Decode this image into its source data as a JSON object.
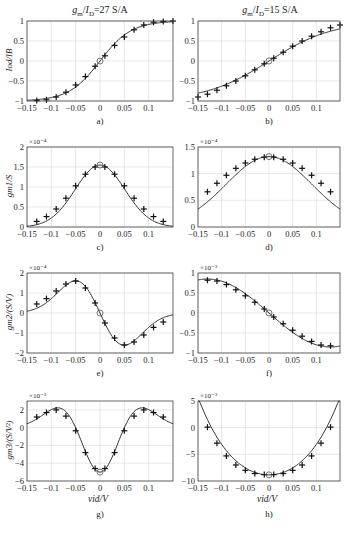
{
  "titles": {
    "left": "g_m / I_D = 27 S/A",
    "right": "g_m / I_D = 15 S/A"
  },
  "chart_data": [
    {
      "id": "a",
      "caption": "a)",
      "type": "line",
      "ylabel": "I_od / I_B",
      "xlabel": "",
      "exponent": "",
      "xlim": [
        -0.15,
        0.15
      ],
      "ylim": [
        -1,
        1
      ],
      "xticks": [
        -0.15,
        -0.1,
        -0.05,
        0,
        0.05,
        0.1
      ],
      "yticks": [
        -1,
        -0.5,
        0,
        0.5,
        1
      ],
      "ytick_labels": [
        "-1",
        "-0.5",
        "0",
        "0.5",
        "1"
      ],
      "grid": true,
      "x": [
        -0.13,
        -0.11,
        -0.09,
        -0.07,
        -0.05,
        -0.03,
        -0.01,
        0.01,
        0.03,
        0.05,
        0.07,
        0.09,
        0.11,
        0.13,
        0.15
      ],
      "y": [
        -0.99,
        -0.97,
        -0.9,
        -0.78,
        -0.6,
        -0.39,
        -0.13,
        0.13,
        0.39,
        0.6,
        0.78,
        0.9,
        0.97,
        0.99,
        1.0
      ],
      "marker_at_zero": "circle"
    },
    {
      "id": "b",
      "caption": "b)",
      "type": "line",
      "ylabel": "",
      "xlabel": "",
      "exponent": "",
      "xlim": [
        -0.15,
        0.15
      ],
      "ylim": [
        -1,
        1
      ],
      "xticks": [
        -0.15,
        -0.1,
        -0.05,
        0,
        0.05,
        0.1
      ],
      "yticks": [
        -1,
        -0.5,
        0,
        0.5,
        1
      ],
      "ytick_labels": [
        "-1",
        "-0.5",
        "0",
        "0.5",
        "1"
      ],
      "grid": true,
      "x": [
        -0.15,
        -0.13,
        -0.11,
        -0.09,
        -0.07,
        -0.05,
        -0.03,
        -0.01,
        0.01,
        0.03,
        0.05,
        0.07,
        0.09,
        0.11,
        0.13,
        0.15
      ],
      "y": [
        -0.9,
        -0.83,
        -0.73,
        -0.62,
        -0.5,
        -0.37,
        -0.22,
        -0.07,
        0.07,
        0.22,
        0.37,
        0.5,
        0.62,
        0.73,
        0.83,
        0.9
      ],
      "marker_at_zero": "circle"
    },
    {
      "id": "c",
      "caption": "c)",
      "type": "line",
      "ylabel": "g_m1 / S",
      "xlabel": "",
      "exponent": "×10⁻⁴",
      "xlim": [
        -0.15,
        0.15
      ],
      "ylim": [
        0,
        2
      ],
      "xticks": [
        -0.15,
        -0.1,
        -0.05,
        0,
        0.05,
        0.1
      ],
      "yticks": [
        0,
        0.5,
        1,
        1.5,
        2
      ],
      "ytick_labels": [
        "0",
        "0.5",
        "1",
        "1.5",
        "2"
      ],
      "grid": true,
      "x": [
        -0.13,
        -0.11,
        -0.09,
        -0.07,
        -0.05,
        -0.03,
        -0.01,
        0.01,
        0.03,
        0.05,
        0.07,
        0.09,
        0.11,
        0.13
      ],
      "y": [
        0.14,
        0.26,
        0.45,
        0.72,
        1.03,
        1.32,
        1.5,
        1.5,
        1.32,
        1.03,
        0.72,
        0.45,
        0.26,
        0.14
      ],
      "marker_at_zero": "circle"
    },
    {
      "id": "d",
      "caption": "d)",
      "type": "line",
      "ylabel": "",
      "xlabel": "",
      "exponent": "×10⁻⁴",
      "xlim": [
        -0.15,
        0.15
      ],
      "ylim": [
        0,
        1.5
      ],
      "xticks": [
        -0.15,
        -0.1,
        -0.05,
        0,
        0.05,
        0.1
      ],
      "yticks": [
        0,
        0.5,
        1,
        1.5
      ],
      "ytick_labels": [
        "0",
        "0.5",
        "1",
        "1.5"
      ],
      "grid": true,
      "x": [
        -0.13,
        -0.11,
        -0.09,
        -0.07,
        -0.05,
        -0.03,
        -0.01,
        0.01,
        0.03,
        0.05,
        0.07,
        0.09,
        0.11,
        0.13
      ],
      "y": [
        0.66,
        0.82,
        0.97,
        1.1,
        1.2,
        1.27,
        1.31,
        1.31,
        1.27,
        1.2,
        1.1,
        0.97,
        0.82,
        0.66
      ],
      "marker_at_zero": "circle"
    },
    {
      "id": "e",
      "caption": "e)",
      "type": "line",
      "ylabel": "g_m2 / (S/V)",
      "xlabel": "",
      "exponent": "×10⁻⁴",
      "xlim": [
        -0.15,
        0.15
      ],
      "ylim": [
        -2,
        2
      ],
      "xticks": [
        -0.15,
        -0.1,
        -0.05,
        0,
        0.05,
        0.1
      ],
      "yticks": [
        -2,
        -1,
        0,
        1,
        2
      ],
      "ytick_labels": [
        "-2",
        "-1",
        "0",
        "1",
        "2"
      ],
      "grid": true,
      "x": [
        -0.13,
        -0.11,
        -0.09,
        -0.07,
        -0.05,
        -0.03,
        -0.01,
        0.01,
        0.03,
        0.05,
        0.07,
        0.09,
        0.11,
        0.13
      ],
      "y": [
        0.45,
        0.72,
        1.1,
        1.45,
        1.6,
        1.25,
        0.5,
        -0.5,
        -1.25,
        -1.6,
        -1.45,
        -1.1,
        -0.72,
        -0.45
      ],
      "marker_at_zero": "circle"
    },
    {
      "id": "f",
      "caption": "f)",
      "type": "line",
      "ylabel": "",
      "xlabel": "",
      "exponent": "×10⁻³",
      "xlim": [
        -0.15,
        0.15
      ],
      "ylim": [
        -1,
        1
      ],
      "xticks": [
        -0.15,
        -0.1,
        -0.05,
        0,
        0.05,
        0.1
      ],
      "yticks": [
        -1,
        -0.5,
        0,
        0.5,
        1
      ],
      "ytick_labels": [
        "-1",
        "-0.5",
        "0",
        "0.5",
        "1"
      ],
      "grid": true,
      "x": [
        -0.13,
        -0.11,
        -0.09,
        -0.07,
        -0.05,
        -0.03,
        -0.01,
        0.01,
        0.03,
        0.05,
        0.07,
        0.09,
        0.11,
        0.13
      ],
      "y": [
        0.82,
        0.8,
        0.71,
        0.58,
        0.43,
        0.27,
        0.1,
        -0.1,
        -0.27,
        -0.43,
        -0.58,
        -0.71,
        -0.8,
        -0.82
      ],
      "marker_at_zero": "circle"
    },
    {
      "id": "g",
      "caption": "g)",
      "type": "line",
      "ylabel": "g_m3 / (S/V²)",
      "xlabel": "v_id / V",
      "exponent": "×10⁻³",
      "xlim": [
        -0.15,
        0.15
      ],
      "ylim": [
        -6,
        3
      ],
      "xticks": [
        -0.15,
        -0.1,
        -0.05,
        0,
        0.05,
        0.1
      ],
      "yticks": [
        -6,
        -4,
        -2,
        0,
        2
      ],
      "ytick_labels": [
        "-6",
        "-4",
        "-2",
        "0",
        "2"
      ],
      "grid": true,
      "x": [
        -0.13,
        -0.11,
        -0.09,
        -0.07,
        -0.05,
        -0.03,
        -0.01,
        0.01,
        0.03,
        0.05,
        0.07,
        0.09,
        0.11,
        0.13
      ],
      "y": [
        1.2,
        1.7,
        2.0,
        1.3,
        -0.35,
        -2.8,
        -4.6,
        -4.6,
        -2.8,
        -0.35,
        1.3,
        2.0,
        1.7,
        1.2
      ],
      "marker_at_zero": "circle"
    },
    {
      "id": "h",
      "caption": "h)",
      "type": "line",
      "ylabel": "",
      "xlabel": "v_id / V",
      "exponent": "×10⁻³",
      "xlim": [
        -0.15,
        0.15
      ],
      "ylim": [
        -10,
        5
      ],
      "xticks": [
        -0.15,
        -0.1,
        -0.05,
        0,
        0.05,
        0.1
      ],
      "yticks": [
        -10,
        -5,
        0,
        5
      ],
      "ytick_labels": [
        "-10",
        "-5",
        "0",
        "5"
      ],
      "grid": true,
      "x": [
        -0.13,
        -0.11,
        -0.09,
        -0.07,
        -0.05,
        -0.03,
        -0.01,
        0.01,
        0.03,
        0.05,
        0.07,
        0.09,
        0.11,
        0.13
      ],
      "y": [
        0.1,
        -2.9,
        -5.3,
        -7.0,
        -8.0,
        -8.6,
        -8.8,
        -8.8,
        -8.6,
        -8.0,
        -7.0,
        -5.3,
        -2.9,
        0.1
      ],
      "marker_at_zero": "circle"
    }
  ],
  "xtick_labels": [
    "-0.15",
    "-0.1",
    "-0.05",
    "0",
    "0.05",
    "0.1"
  ],
  "colors": {
    "line": "#333333",
    "grid": "#d8d8d8",
    "frame": "#444444"
  }
}
